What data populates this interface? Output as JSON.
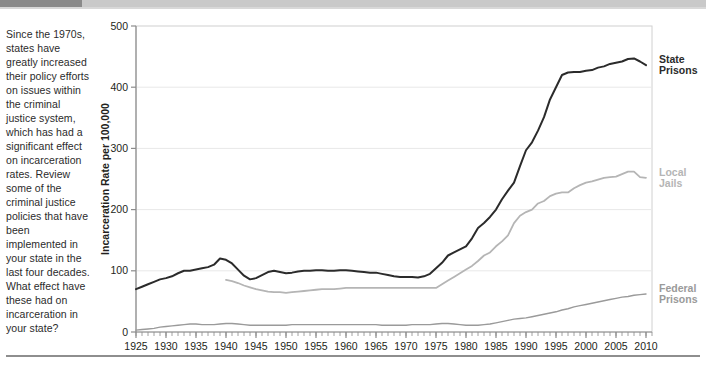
{
  "intro": {
    "text": "Since the 1970s, states have greatly increased their policy efforts on issues within the criminal justice system, which has had a significant effect on incarceration rates. Review some of the criminal justice policies that have been implemented in your state in the last four decades. What effect have these had on incarceration in your state?"
  },
  "colors": {
    "state_prisons": "#2b2b2b",
    "local_jails": "#b5b5b5",
    "federal_prisons": "#9a9a9a",
    "gridline": "#e8e8e8",
    "axis": "#8c8c8c",
    "header_dark": "#8a8a8a",
    "header_light": "#c9c9c9",
    "rule": "#8e8e8e"
  },
  "chart_data": {
    "type": "line",
    "title": "",
    "xlabel": "",
    "ylabel": "Incarceration Rate per 100,000",
    "xlim": [
      1925,
      2011
    ],
    "ylim": [
      0,
      500
    ],
    "yticks": [
      0,
      100,
      200,
      300,
      400,
      500
    ],
    "xticks": [
      1925,
      1930,
      1935,
      1940,
      1945,
      1950,
      1955,
      1960,
      1965,
      1970,
      1975,
      1980,
      1985,
      1990,
      1995,
      2000,
      2005,
      2010
    ],
    "minor_xtick_interval": 1,
    "grid": "horizontal",
    "legend_position": "right-inline",
    "series": [
      {
        "name": "State Prisons",
        "color": "#2b2b2b",
        "x": [
          1925,
          1926,
          1927,
          1928,
          1929,
          1930,
          1931,
          1932,
          1933,
          1934,
          1935,
          1936,
          1937,
          1938,
          1939,
          1940,
          1941,
          1942,
          1943,
          1944,
          1945,
          1946,
          1947,
          1948,
          1949,
          1950,
          1951,
          1952,
          1953,
          1954,
          1955,
          1956,
          1957,
          1958,
          1959,
          1960,
          1961,
          1962,
          1963,
          1964,
          1965,
          1966,
          1967,
          1968,
          1969,
          1970,
          1971,
          1972,
          1973,
          1974,
          1975,
          1976,
          1977,
          1978,
          1979,
          1980,
          1981,
          1982,
          1983,
          1984,
          1985,
          1986,
          1987,
          1988,
          1989,
          1990,
          1991,
          1992,
          1993,
          1994,
          1995,
          1996,
          1997,
          1998,
          1999,
          2000,
          2001,
          2002,
          2003,
          2004,
          2005,
          2006,
          2007,
          2008,
          2009,
          2010
        ],
        "values": [
          70,
          74,
          78,
          82,
          86,
          88,
          91,
          96,
          100,
          100,
          102,
          104,
          106,
          110,
          120,
          118,
          112,
          102,
          92,
          86,
          88,
          93,
          98,
          100,
          98,
          96,
          97,
          99,
          100,
          100,
          101,
          101,
          100,
          100,
          101,
          101,
          100,
          99,
          98,
          97,
          97,
          95,
          93,
          91,
          90,
          90,
          90,
          89,
          91,
          95,
          104,
          113,
          125,
          130,
          135,
          140,
          153,
          170,
          178,
          188,
          200,
          217,
          231,
          244,
          271,
          297,
          310,
          329,
          351,
          380,
          400,
          420,
          424,
          425,
          425,
          427,
          428,
          432,
          434,
          438,
          440,
          442,
          446,
          447,
          442,
          436
        ]
      },
      {
        "name": "Local Jails",
        "color": "#b5b5b5",
        "x": [
          1940,
          1941,
          1942,
          1943,
          1944,
          1945,
          1946,
          1947,
          1948,
          1949,
          1950,
          1951,
          1952,
          1953,
          1954,
          1955,
          1956,
          1957,
          1958,
          1959,
          1960,
          1961,
          1962,
          1963,
          1964,
          1965,
          1966,
          1967,
          1968,
          1969,
          1970,
          1971,
          1972,
          1973,
          1974,
          1975,
          1976,
          1977,
          1978,
          1979,
          1980,
          1981,
          1982,
          1983,
          1984,
          1985,
          1986,
          1987,
          1988,
          1989,
          1990,
          1991,
          1992,
          1993,
          1994,
          1995,
          1996,
          1997,
          1998,
          1999,
          2000,
          2001,
          2002,
          2003,
          2004,
          2005,
          2006,
          2007,
          2008,
          2009,
          2010
        ],
        "values": [
          85,
          83,
          80,
          76,
          73,
          70,
          68,
          66,
          65,
          65,
          64,
          65,
          66,
          67,
          68,
          69,
          70,
          70,
          70,
          71,
          72,
          72,
          72,
          72,
          72,
          72,
          72,
          72,
          72,
          72,
          72,
          72,
          72,
          72,
          72,
          72,
          78,
          84,
          90,
          96,
          102,
          108,
          116,
          125,
          130,
          140,
          148,
          158,
          178,
          190,
          196,
          200,
          210,
          214,
          222,
          226,
          228,
          228,
          235,
          240,
          244,
          246,
          249,
          252,
          253,
          254,
          258,
          262,
          262,
          253,
          252
        ]
      },
      {
        "name": "Federal Prisons",
        "color": "#9a9a9a",
        "x": [
          1925,
          1926,
          1927,
          1928,
          1929,
          1930,
          1931,
          1932,
          1933,
          1934,
          1935,
          1936,
          1937,
          1938,
          1939,
          1940,
          1941,
          1942,
          1943,
          1944,
          1945,
          1946,
          1947,
          1948,
          1949,
          1950,
          1951,
          1952,
          1953,
          1954,
          1955,
          1956,
          1957,
          1958,
          1959,
          1960,
          1961,
          1962,
          1963,
          1964,
          1965,
          1966,
          1967,
          1968,
          1969,
          1970,
          1971,
          1972,
          1973,
          1974,
          1975,
          1976,
          1977,
          1978,
          1979,
          1980,
          1981,
          1982,
          1983,
          1984,
          1985,
          1986,
          1987,
          1988,
          1989,
          1990,
          1991,
          1992,
          1993,
          1994,
          1995,
          1996,
          1997,
          1998,
          1999,
          2000,
          2001,
          2002,
          2003,
          2004,
          2005,
          2006,
          2007,
          2008,
          2009,
          2010
        ],
        "values": [
          3,
          4,
          5,
          6,
          8,
          9,
          10,
          11,
          12,
          13,
          13,
          12,
          12,
          12,
          13,
          14,
          14,
          13,
          12,
          11,
          11,
          11,
          11,
          11,
          11,
          11,
          12,
          12,
          12,
          12,
          12,
          12,
          12,
          12,
          12,
          12,
          12,
          12,
          12,
          12,
          12,
          11,
          11,
          11,
          11,
          11,
          12,
          12,
          12,
          12,
          13,
          14,
          14,
          13,
          12,
          11,
          11,
          11,
          12,
          13,
          15,
          17,
          19,
          21,
          22,
          23,
          25,
          27,
          29,
          31,
          33,
          36,
          38,
          41,
          43,
          45,
          47,
          49,
          51,
          53,
          55,
          57,
          58,
          60,
          61,
          62
        ]
      }
    ],
    "annotations": []
  }
}
